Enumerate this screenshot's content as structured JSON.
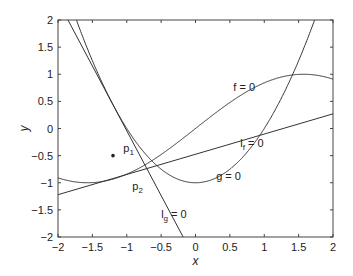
{
  "chart_data": {
    "type": "line",
    "title": "",
    "xlabel": "x",
    "ylabel": "y",
    "xlim": [
      -2,
      2
    ],
    "ylim": [
      -2,
      2
    ],
    "xticks": [
      "-2",
      "-1.5",
      "-1",
      "-0.5",
      "0",
      "0.5",
      "1",
      "1.5",
      "2"
    ],
    "yticks": [
      "-2",
      "-1.5",
      "-1",
      "-0.5",
      "0",
      "0.5",
      "1",
      "1.5",
      "2"
    ],
    "grid": false,
    "legend": "none",
    "series": [
      {
        "name": "f = 0",
        "kind": "curve",
        "formula": "y = sin(x)"
      },
      {
        "name": "g = 0",
        "kind": "curve",
        "formula": "y = x^2 - 1"
      },
      {
        "name": "l_f = 0",
        "kind": "line",
        "points": [
          [
            -2,
            -1.22
          ],
          [
            2,
            0.27
          ]
        ]
      },
      {
        "name": "l_g = 0",
        "kind": "line",
        "points": [
          [
            -1.855,
            2
          ],
          [
            -0.18,
            -2
          ]
        ]
      }
    ],
    "points": [
      {
        "name": "p1",
        "x": -1.2,
        "y": -0.5
      }
    ],
    "annotations": [
      {
        "text": "f = 0",
        "x": 0.55,
        "y": 0.7
      },
      {
        "text": "l",
        "sub": "f",
        "suffix": " = 0",
        "x": 0.65,
        "y": -0.35
      },
      {
        "text": "g = 0",
        "x": 0.3,
        "y": -0.95
      },
      {
        "text": "l",
        "sub": "g",
        "suffix": " = 0",
        "x": -0.5,
        "y": -1.65
      },
      {
        "text": "p",
        "sub": "1",
        "x": -1.05,
        "y": -0.43
      },
      {
        "text": "p",
        "sub": "2",
        "x": -0.92,
        "y": -1.13
      }
    ]
  }
}
